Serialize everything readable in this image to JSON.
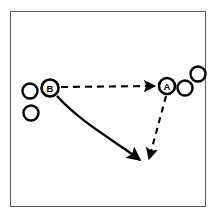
{
  "diagram": {
    "court": {
      "name": "half-court-frame",
      "border_color": "#5a5a5a",
      "fill_color": "#ffffff",
      "x": 10,
      "y": 11,
      "width": 196,
      "height": 196
    },
    "stroke_color": "#000000",
    "players": [
      {
        "id": "B",
        "label": "B",
        "name": "player-marker-b",
        "cx": 50,
        "cy": 88,
        "r": 8.5
      },
      {
        "id": "A",
        "label": "A",
        "name": "player-marker-a",
        "cx": 167,
        "cy": 86,
        "r": 8.0
      }
    ],
    "balls": [
      {
        "name": "ball-left-upper",
        "cx": 30,
        "cy": 91,
        "r": 7.5
      },
      {
        "name": "ball-left-lower",
        "cx": 31,
        "cy": 113,
        "r": 7.5
      },
      {
        "name": "ball-right-lower",
        "cx": 185,
        "cy": 88,
        "r": 7.5
      },
      {
        "name": "ball-right-upper",
        "cx": 198,
        "cy": 74,
        "r": 7.5
      }
    ],
    "paths": [
      {
        "name": "pass-arrow-b-to-a",
        "style": "dashed",
        "meaning": "pass",
        "d": "M 61 87 L 155 86",
        "dash": "7,5",
        "arrowhead": true
      },
      {
        "name": "cut-arrow-b-to-post",
        "style": "solid",
        "meaning": "cut / drive",
        "d": "M 57 96 C 80 122 118 143 140 160",
        "dash": "",
        "arrowhead": true
      },
      {
        "name": "pass-arrow-a-to-post",
        "style": "dashed",
        "meaning": "pass",
        "d": "M 166 96 L 149 159",
        "dash": "6,5",
        "arrowhead": true
      }
    ]
  }
}
